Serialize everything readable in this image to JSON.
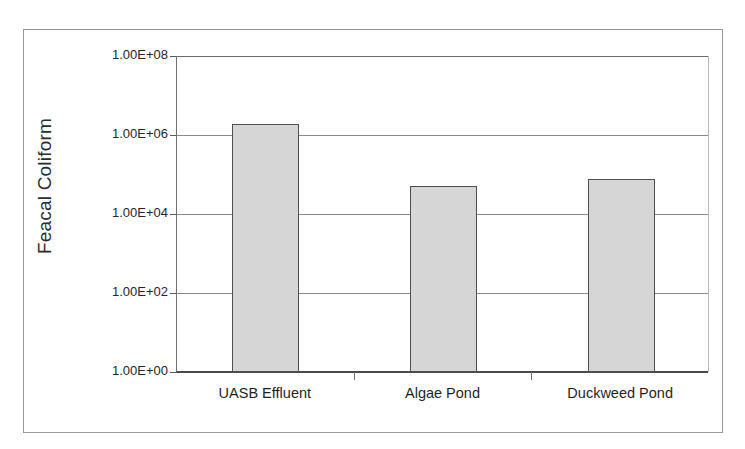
{
  "chart_data": {
    "type": "bar",
    "title": "",
    "xlabel": "",
    "ylabel": "Feacal Coliform",
    "categories": [
      "UASB Effluent",
      "Algae Pond",
      "Duckweed Pond"
    ],
    "values": [
      1900000,
      51000,
      78000
    ],
    "value_labels": [
      "1.9E+06",
      "5.1E+04",
      "7.8E+04"
    ],
    "yscale": "log",
    "ylim": [
      1,
      100000000
    ],
    "ytick_labels": [
      "1.00E+08",
      "1.00E+06",
      "1.00E+04",
      "1.00E+02",
      "1.00E+00"
    ],
    "ytick_values": [
      100000000,
      1000000,
      10000,
      100,
      1
    ],
    "grid": true,
    "legend": false,
    "legend_position": "none",
    "bar_fill_color": "#d6d6d6",
    "bar_border_color": "#4f4f4f",
    "gridline_color": "#8a8a8a",
    "axis_color": "#4a4a4a",
    "frame_color": "#9a9a9a",
    "background_color": "#ffffff"
  },
  "figure": {
    "outer_border_label": "chart-frame"
  }
}
